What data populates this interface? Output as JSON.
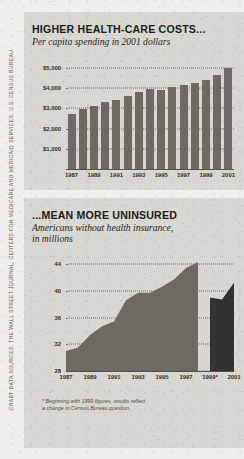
{
  "credit": {
    "text": "CHART DATA SOURCES: THE WALL STREET JOURNAL; CENTERS FOR MEDICARE AND MEDICAID SERVICES; U.S. CENSUS BUREAU"
  },
  "panels": {
    "costs": {
      "title": "HIGHER HEALTH-CARE COSTS...",
      "subtitle": "Per capita spending in 2001 dollars"
    },
    "uninsured": {
      "title": "...MEAN MORE UNINSURED",
      "subtitle": "Americans without health insurance,\nin millions",
      "footnote": "* Beginning with 1999 figures, results reflect\na change in Census Bureau question."
    }
  },
  "chart_data": [
    {
      "type": "bar",
      "title": "HIGHER HEALTH-CARE COSTS...",
      "subtitle": "Per capita spending in 2001 dollars",
      "xlabel": "",
      "ylabel": "",
      "ylim": [
        0,
        5400
      ],
      "grid": true,
      "ytick_values": [
        1000,
        2000,
        3000,
        4000,
        5000
      ],
      "ytick_labels": [
        "$1,000",
        "$2,000",
        "$3,000",
        "$4,000",
        "$5,000"
      ],
      "xtick_labels": [
        "1987",
        "1989",
        "1991",
        "1993",
        "1995",
        "1997",
        "1999",
        "2001"
      ],
      "categories": [
        "1987",
        "1988",
        "1989",
        "1990",
        "1991",
        "1992",
        "1993",
        "1994",
        "1995",
        "1996",
        "1997",
        "1998",
        "1999",
        "2000",
        "2001"
      ],
      "values": [
        2750,
        2950,
        3120,
        3300,
        3400,
        3620,
        3800,
        3950,
        3900,
        4050,
        4150,
        4250,
        4400,
        4650,
        5000
      ],
      "bar_color": "#6d6a64"
    },
    {
      "type": "area",
      "title": "...MEAN MORE UNINSURED",
      "subtitle": "Americans without health insurance, in millions",
      "xlabel": "",
      "ylabel": "",
      "ylim": [
        28,
        45.5
      ],
      "grid": true,
      "ytick_values": [
        28,
        32,
        36,
        40,
        44
      ],
      "ytick_labels": [
        "28",
        "32",
        "36",
        "40",
        "44"
      ],
      "xtick_labels": [
        "1987",
        "1989",
        "1991",
        "1993",
        "1995",
        "1997",
        "1999*",
        "2001"
      ],
      "x": [
        "1987",
        "1988",
        "1989",
        "1990",
        "1991",
        "1992",
        "1993",
        "1994",
        "1995",
        "1996",
        "1997",
        "1998",
        "1999",
        "2000",
        "2001"
      ],
      "values": [
        31.0,
        31.5,
        33.4,
        34.7,
        35.4,
        38.6,
        39.7,
        39.7,
        40.6,
        41.7,
        43.4,
        44.3,
        39.0,
        38.7,
        41.2
      ],
      "segments": [
        {
          "name": "pre-1999 methodology",
          "x_range": [
            "1987",
            "1998"
          ],
          "color": "#6d6a64"
        },
        {
          "name": "revised methodology",
          "x_range": [
            "1999",
            "2001"
          ],
          "color": "#34322f"
        }
      ],
      "annotations": [
        "* Beginning with 1999 figures, results reflect a change in Census Bureau question."
      ]
    }
  ]
}
